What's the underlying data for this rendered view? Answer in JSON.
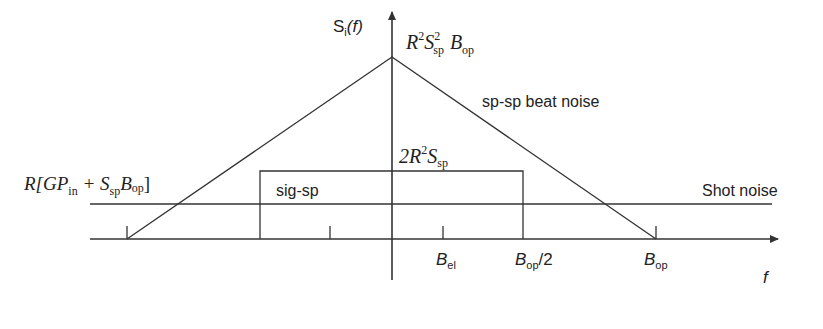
{
  "diagram": {
    "y_axis": {
      "label_main": "S",
      "label_sub": "i",
      "label_arg": "(f)"
    },
    "x_axis": {
      "label": "f"
    },
    "peak_label": {
      "a": "R",
      "a_sup": "2",
      "b": "S",
      "b_sup": "2",
      "b_sub": "sp",
      "c": "B",
      "c_sub": "op"
    },
    "sig_sp_level_label": {
      "a": "2R",
      "a_sup": "2",
      "b": "S",
      "b_sub": "sp"
    },
    "shot_level_label": {
      "prefix": "R[GP",
      "sub1": "in",
      "mid": " + S",
      "sub2": "sp",
      "mid2": "B",
      "sub3": "op",
      "suffix": "]"
    },
    "curve_labels": {
      "sp_sp": "sp-sp beat noise",
      "sig_sp": "sig-sp",
      "shot": "Shot noise"
    },
    "ticks": [
      {
        "label": "B",
        "sub": "el",
        "suffix": ""
      },
      {
        "label": "B",
        "sub": "op",
        "suffix": "/2"
      },
      {
        "label": "B",
        "sub": "op",
        "suffix": ""
      }
    ],
    "colors": {
      "line": "#333333",
      "text": "#222222"
    }
  }
}
